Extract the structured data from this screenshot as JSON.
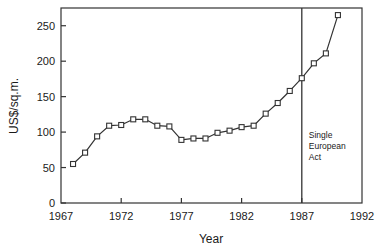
{
  "chart_data": {
    "type": "line",
    "title": "",
    "xlabel": "Year",
    "ylabel": "US$/sq.m.",
    "xlim": [
      1967,
      1992
    ],
    "ylim": [
      0,
      275
    ],
    "grid": false,
    "legend": "none",
    "marker": "open-square",
    "line_color": "#333333",
    "marker_fill": "#ffffff",
    "xticks": [
      1967,
      1972,
      1977,
      1982,
      1987,
      1992
    ],
    "xtick_labels": [
      "1967",
      "1972",
      "1977",
      "1982",
      "1987",
      "1992"
    ],
    "yticks": [
      0,
      50,
      100,
      150,
      200,
      250
    ],
    "ytick_labels": [
      "0",
      "50",
      "100",
      "150",
      "200",
      "250"
    ],
    "x": [
      1968,
      1969,
      1970,
      1971,
      1972,
      1973,
      1974,
      1975,
      1976,
      1977,
      1978,
      1979,
      1980,
      1981,
      1982,
      1983,
      1984,
      1985,
      1986,
      1987,
      1988,
      1989,
      1990
    ],
    "values": [
      55,
      71,
      94,
      109,
      110,
      118,
      118,
      109,
      108,
      89,
      91,
      91,
      99,
      102,
      107,
      109,
      126,
      141,
      158,
      176,
      197,
      211,
      265
    ],
    "annotations": [
      {
        "name": "single-european-act",
        "x": 1987,
        "type": "vertical-line",
        "lines": [
          "Single",
          "European",
          "Act"
        ]
      }
    ]
  }
}
